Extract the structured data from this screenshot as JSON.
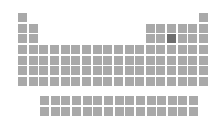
{
  "periodic_table": {
    "cell_color": "#a9a9a9",
    "selected_color": "#6f6f6f",
    "selected_element": "P",
    "layout": {
      "origin_x": 18,
      "origin_y": 13,
      "pitch": 10.65,
      "fblock_origin_x": 40,
      "fblock_origin_y": 96
    },
    "main": [
      {
        "s": "H",
        "r": 1,
        "c": 1
      },
      {
        "s": "He",
        "r": 1,
        "c": 18
      },
      {
        "s": "Li",
        "r": 2,
        "c": 1
      },
      {
        "s": "Be",
        "r": 2,
        "c": 2
      },
      {
        "s": "B",
        "r": 2,
        "c": 13
      },
      {
        "s": "C",
        "r": 2,
        "c": 14
      },
      {
        "s": "N",
        "r": 2,
        "c": 15
      },
      {
        "s": "O",
        "r": 2,
        "c": 16
      },
      {
        "s": "F",
        "r": 2,
        "c": 17
      },
      {
        "s": "Ne",
        "r": 2,
        "c": 18
      },
      {
        "s": "Na",
        "r": 3,
        "c": 1
      },
      {
        "s": "Mg",
        "r": 3,
        "c": 2
      },
      {
        "s": "Al",
        "r": 3,
        "c": 13
      },
      {
        "s": "Si",
        "r": 3,
        "c": 14
      },
      {
        "s": "P",
        "r": 3,
        "c": 15
      },
      {
        "s": "S",
        "r": 3,
        "c": 16
      },
      {
        "s": "Cl",
        "r": 3,
        "c": 17
      },
      {
        "s": "Ar",
        "r": 3,
        "c": 18
      },
      {
        "s": "K",
        "r": 4,
        "c": 1
      },
      {
        "s": "Ca",
        "r": 4,
        "c": 2
      },
      {
        "s": "Sc",
        "r": 4,
        "c": 3
      },
      {
        "s": "Ti",
        "r": 4,
        "c": 4
      },
      {
        "s": "V",
        "r": 4,
        "c": 5
      },
      {
        "s": "Cr",
        "r": 4,
        "c": 6
      },
      {
        "s": "Mn",
        "r": 4,
        "c": 7
      },
      {
        "s": "Fe",
        "r": 4,
        "c": 8
      },
      {
        "s": "Co",
        "r": 4,
        "c": 9
      },
      {
        "s": "Ni",
        "r": 4,
        "c": 10
      },
      {
        "s": "Cu",
        "r": 4,
        "c": 11
      },
      {
        "s": "Zn",
        "r": 4,
        "c": 12
      },
      {
        "s": "Ga",
        "r": 4,
        "c": 13
      },
      {
        "s": "Ge",
        "r": 4,
        "c": 14
      },
      {
        "s": "As",
        "r": 4,
        "c": 15
      },
      {
        "s": "Se",
        "r": 4,
        "c": 16
      },
      {
        "s": "Br",
        "r": 4,
        "c": 17
      },
      {
        "s": "Kr",
        "r": 4,
        "c": 18
      },
      {
        "s": "Rb",
        "r": 5,
        "c": 1
      },
      {
        "s": "Sr",
        "r": 5,
        "c": 2
      },
      {
        "s": "Y",
        "r": 5,
        "c": 3
      },
      {
        "s": "Zr",
        "r": 5,
        "c": 4
      },
      {
        "s": "Nb",
        "r": 5,
        "c": 5
      },
      {
        "s": "Mo",
        "r": 5,
        "c": 6
      },
      {
        "s": "Tc",
        "r": 5,
        "c": 7
      },
      {
        "s": "Ru",
        "r": 5,
        "c": 8
      },
      {
        "s": "Rh",
        "r": 5,
        "c": 9
      },
      {
        "s": "Pd",
        "r": 5,
        "c": 10
      },
      {
        "s": "Ag",
        "r": 5,
        "c": 11
      },
      {
        "s": "Cd",
        "r": 5,
        "c": 12
      },
      {
        "s": "In",
        "r": 5,
        "c": 13
      },
      {
        "s": "Sn",
        "r": 5,
        "c": 14
      },
      {
        "s": "Sb",
        "r": 5,
        "c": 15
      },
      {
        "s": "Te",
        "r": 5,
        "c": 16
      },
      {
        "s": "I",
        "r": 5,
        "c": 17
      },
      {
        "s": "Xe",
        "r": 5,
        "c": 18
      },
      {
        "s": "Cs",
        "r": 6,
        "c": 1
      },
      {
        "s": "Ba",
        "r": 6,
        "c": 2
      },
      {
        "s": "La",
        "r": 6,
        "c": 3
      },
      {
        "s": "Hf",
        "r": 6,
        "c": 4
      },
      {
        "s": "Ta",
        "r": 6,
        "c": 5
      },
      {
        "s": "W",
        "r": 6,
        "c": 6
      },
      {
        "s": "Re",
        "r": 6,
        "c": 7
      },
      {
        "s": "Os",
        "r": 6,
        "c": 8
      },
      {
        "s": "Ir",
        "r": 6,
        "c": 9
      },
      {
        "s": "Pt",
        "r": 6,
        "c": 10
      },
      {
        "s": "Au",
        "r": 6,
        "c": 11
      },
      {
        "s": "Hg",
        "r": 6,
        "c": 12
      },
      {
        "s": "Tl",
        "r": 6,
        "c": 13
      },
      {
        "s": "Pb",
        "r": 6,
        "c": 14
      },
      {
        "s": "Bi",
        "r": 6,
        "c": 15
      },
      {
        "s": "Po",
        "r": 6,
        "c": 16
      },
      {
        "s": "At",
        "r": 6,
        "c": 17
      },
      {
        "s": "Rn",
        "r": 6,
        "c": 18
      },
      {
        "s": "Fr",
        "r": 7,
        "c": 1
      },
      {
        "s": "Ra",
        "r": 7,
        "c": 2
      },
      {
        "s": "Ac",
        "r": 7,
        "c": 3
      },
      {
        "s": "Rf",
        "r": 7,
        "c": 4
      },
      {
        "s": "Db",
        "r": 7,
        "c": 5
      },
      {
        "s": "Sg",
        "r": 7,
        "c": 6
      },
      {
        "s": "Bh",
        "r": 7,
        "c": 7
      },
      {
        "s": "Hs",
        "r": 7,
        "c": 8
      },
      {
        "s": "Mt",
        "r": 7,
        "c": 9
      },
      {
        "s": "Ds",
        "r": 7,
        "c": 10
      },
      {
        "s": "Rg",
        "r": 7,
        "c": 11
      },
      {
        "s": "Cn",
        "r": 7,
        "c": 12
      },
      {
        "s": "Nh",
        "r": 7,
        "c": 13
      },
      {
        "s": "Fl",
        "r": 7,
        "c": 14
      },
      {
        "s": "Mc",
        "r": 7,
        "c": 15
      },
      {
        "s": "Lv",
        "r": 7,
        "c": 16
      },
      {
        "s": "Ts",
        "r": 7,
        "c": 17
      },
      {
        "s": "Og",
        "r": 7,
        "c": 18
      }
    ],
    "lanthanides": [
      "Ce",
      "Pr",
      "Nd",
      "Pm",
      "Sm",
      "Eu",
      "Gd",
      "Tb",
      "Dy",
      "Ho",
      "Er",
      "Tm",
      "Yb",
      "Lu",
      "La*"
    ],
    "actinides": [
      "Th",
      "Pa",
      "U",
      "Np",
      "Pu",
      "Am",
      "Cm",
      "Bk",
      "Cf",
      "Es",
      "Fm",
      "Md",
      "No",
      "Lr",
      "Ac*"
    ]
  }
}
